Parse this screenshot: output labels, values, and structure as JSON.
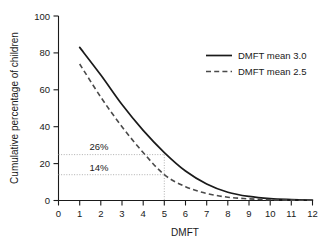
{
  "chart_data": {
    "type": "line",
    "title": "",
    "xlabel": "DMFT",
    "ylabel": "Cumulative percentage of children",
    "xlim": [
      0,
      12
    ],
    "ylim": [
      0,
      100
    ],
    "grid": false,
    "legend_position": "top-right",
    "xticks": [
      "0",
      "1",
      "2",
      "3",
      "4",
      "5",
      "6",
      "7",
      "8",
      "9",
      "10",
      "11",
      "12"
    ],
    "yticks": [
      "0",
      "20",
      "40",
      "60",
      "80",
      "100"
    ],
    "x": [
      1,
      2,
      3,
      4,
      5,
      6,
      7,
      8,
      9,
      10,
      11,
      12
    ],
    "series": [
      {
        "name": "DMFT mean 3.0",
        "style": "solid",
        "color": "#1a1a1a",
        "values": [
          83,
          68,
          52,
          38,
          26,
          16,
          9,
          4.5,
          2.2,
          1.0,
          0.5,
          0.2
        ]
      },
      {
        "name": "DMFT mean 2.5",
        "style": "dashed",
        "color": "#4a4a4a",
        "values": [
          74,
          56,
          40,
          26,
          14,
          7.5,
          3.8,
          1.8,
          0.9,
          0.4,
          0.2,
          0.1
        ]
      }
    ],
    "annotations": [
      {
        "label": "26%",
        "value": 26,
        "at_x": 5,
        "series": "DMFT mean 3.0"
      },
      {
        "label": "14%",
        "value": 14,
        "at_x": 5,
        "series": "DMFT mean 2.5"
      }
    ],
    "reference_lines": {
      "vertical_x": 5,
      "horizontal_y": [
        26,
        14
      ]
    }
  },
  "legend": {
    "items": [
      {
        "label": "DMFT mean 3.0"
      },
      {
        "label": "DMFT mean 2.5"
      }
    ]
  },
  "caption": {
    "text": ""
  }
}
